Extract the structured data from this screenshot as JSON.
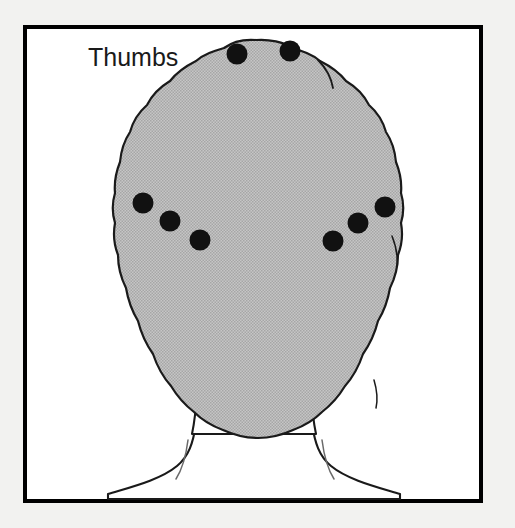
{
  "figure": {
    "name": "back-of-head-thumb-placement-diagram",
    "canvas": {
      "width": 515,
      "height": 528
    },
    "background_color": "#f2f2f0",
    "panel": {
      "fill": "#ffffff",
      "border_color": "#000000",
      "border_width": 4,
      "x": 23,
      "y": 25,
      "width": 460,
      "height": 478
    },
    "annotation": {
      "label": "Thumbs",
      "x": 88,
      "y": 66,
      "font_size": 25,
      "color": "#1a1a1a"
    },
    "head": {
      "hair_fill": "#b8b8b8",
      "hair_fill_note": "halftone dotted gray",
      "outline_color": "#1a1a1a",
      "outline_width": 2.2,
      "skin_fill": "#ffffff",
      "description": "posterior view of head and shoulders, scalloped hair silhouette, neck flaring into shoulders"
    },
    "marker_style": {
      "fill": "#111111",
      "radius": 10.5,
      "count": 8
    },
    "markers": [
      {
        "id": "crown-left",
        "group": "crown",
        "side": "left",
        "x": 237,
        "y": 54
      },
      {
        "id": "crown-right",
        "group": "crown",
        "side": "right",
        "x": 290,
        "y": 51
      },
      {
        "id": "left-upper",
        "group": "temporal",
        "side": "left",
        "x": 143,
        "y": 203
      },
      {
        "id": "left-middle",
        "group": "temporal",
        "side": "left",
        "x": 170,
        "y": 221
      },
      {
        "id": "left-lower",
        "group": "temporal",
        "side": "left",
        "x": 200,
        "y": 240
      },
      {
        "id": "right-lower",
        "group": "temporal",
        "side": "right",
        "x": 333,
        "y": 241
      },
      {
        "id": "right-middle",
        "group": "temporal",
        "side": "right",
        "x": 358,
        "y": 223
      },
      {
        "id": "right-upper",
        "group": "temporal",
        "side": "right",
        "x": 385,
        "y": 207
      }
    ]
  }
}
